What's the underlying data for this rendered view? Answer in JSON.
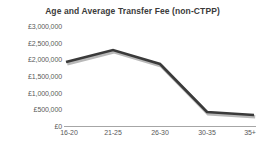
{
  "chart_data": {
    "type": "line",
    "title": "Age and Average Transfer Fee (non-CTPP)",
    "xlabel": "",
    "ylabel": "",
    "categories": [
      "16-20",
      "21-25",
      "26-30",
      "30-35",
      "35+"
    ],
    "values": [
      1920000,
      2280000,
      1860000,
      420000,
      330000
    ],
    "series": [
      {
        "name": "Average Transfer Fee",
        "values": [
          1920000,
          2280000,
          1860000,
          420000,
          330000
        ]
      }
    ],
    "ylim": [
      0,
      3000000
    ],
    "ytick_values": [
      0,
      500000,
      1000000,
      1500000,
      2000000,
      2500000,
      3000000
    ],
    "ytick_labels": [
      "£0",
      "£500,000",
      "£1,000,000",
      "£1,500,000",
      "£2,000,000",
      "£2,500,000",
      "£3,000,000"
    ],
    "grid": false,
    "legend": "none",
    "line_color": "#3a3a3a",
    "shadow_color": "#b9b9b9",
    "axis_color": "#a6a6a6",
    "text_color": "#5a5a5a",
    "title_color": "#3b3b3b",
    "background_color": "#ffffff"
  }
}
